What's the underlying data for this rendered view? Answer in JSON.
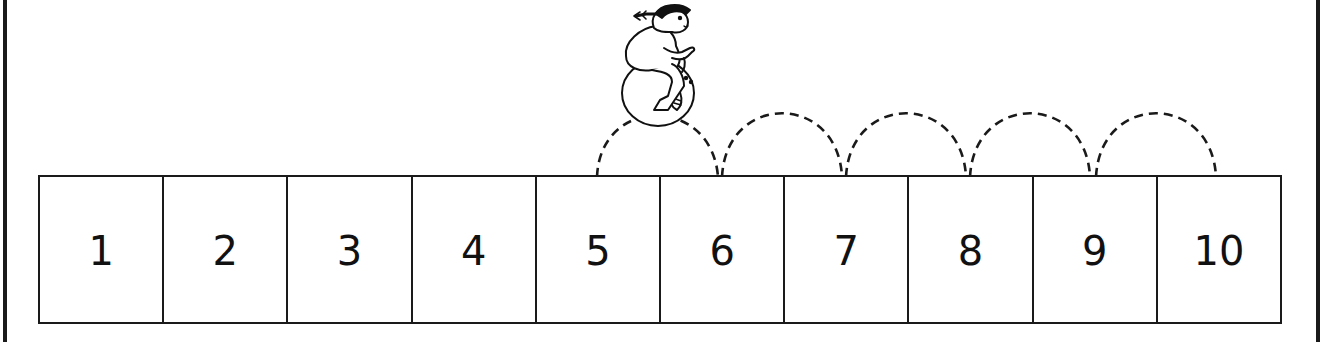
{
  "number_line": {
    "cells": [
      {
        "label": "1"
      },
      {
        "label": "2"
      },
      {
        "label": "3"
      },
      {
        "label": "4"
      },
      {
        "label": "5"
      },
      {
        "label": "6"
      },
      {
        "label": "7"
      },
      {
        "label": "8"
      },
      {
        "label": "9"
      },
      {
        "label": "10"
      }
    ],
    "start": "5",
    "end": "10",
    "hops": 5
  },
  "illustration": {
    "figure": "girl-on-space-hopper",
    "position_over": "5-6"
  },
  "colors": {
    "line": "#1a1a1a",
    "background": "#ffffff"
  }
}
